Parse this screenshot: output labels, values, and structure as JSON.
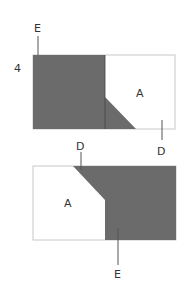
{
  "step_number": "4",
  "colors": {
    "dark": "#6b6b6b",
    "outline": "#c8c8c8",
    "line": "#555555",
    "text": "#333333"
  },
  "top_panel": {
    "label_top_left": "E",
    "label_center": "A",
    "label_bottom_right": "D",
    "label_bottom_middle": "D"
  },
  "bottom_panel": {
    "label_top": "D",
    "label_center": "A",
    "label_bottom": "E"
  }
}
